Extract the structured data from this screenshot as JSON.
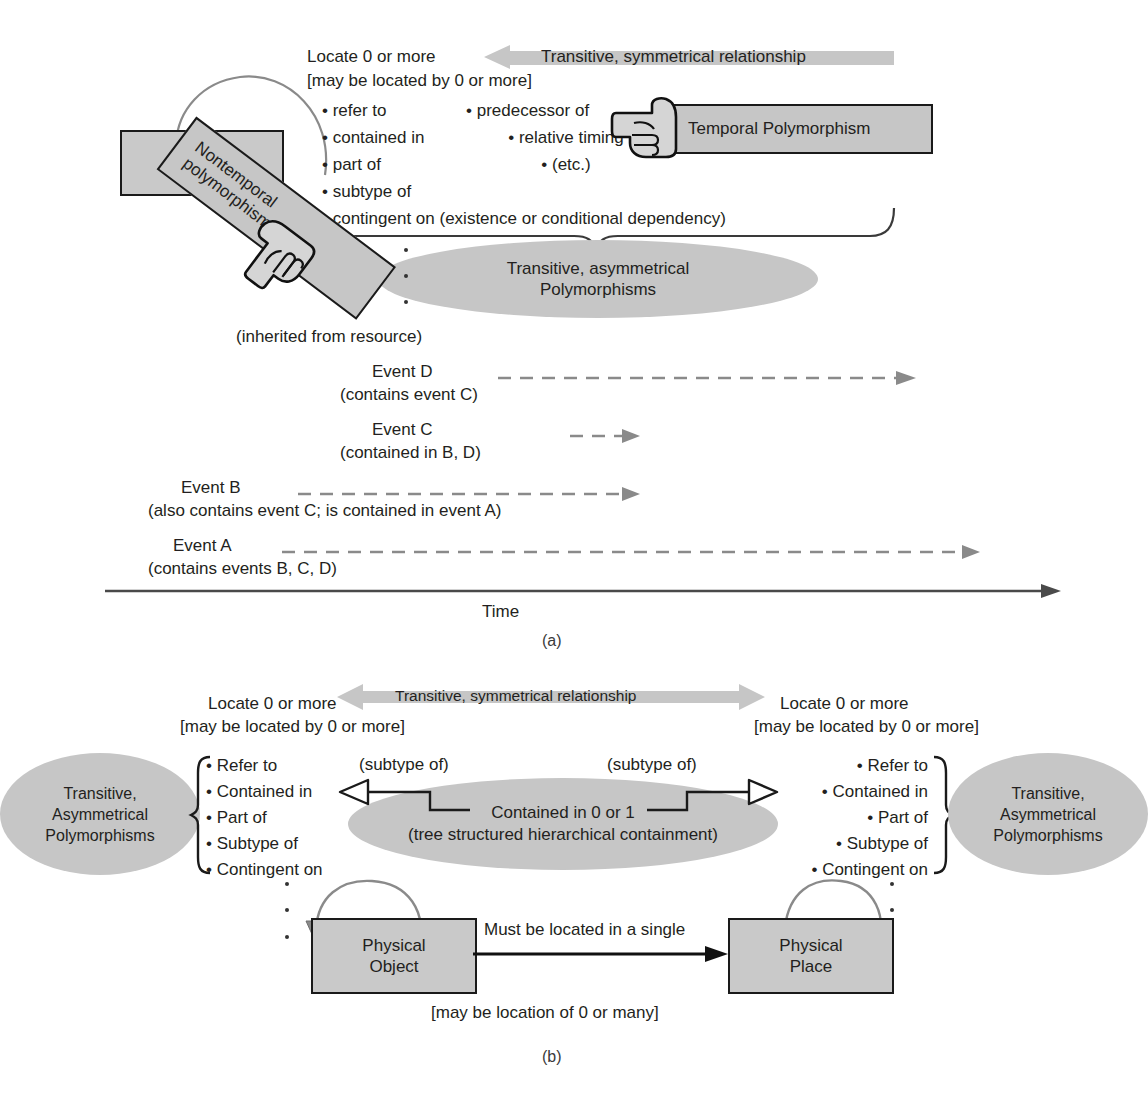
{
  "figure": {
    "panel_a_label": "(a)",
    "panel_b_label": "(b)"
  },
  "panel_a": {
    "event_box": "Event",
    "locate_line1": "Locate 0 or more",
    "locate_line2": "[may be located by 0 or more]",
    "symmetrical_banner": "Transitive, symmetrical relationship",
    "left_list": [
      "refer to",
      "contained in",
      "part of",
      "subtype of",
      "contingent on (existence or conditional dependency)"
    ],
    "temporal_list": [
      "predecessor of",
      "relative timing",
      "(etc.)"
    ],
    "temporal_banner": "Temporal Polymorphism",
    "nontemporal_banner_line1": "Nontemporal",
    "nontemporal_banner_line2": "polymorphism",
    "asym_ellipse_line1": "Transitive, asymmetrical",
    "asym_ellipse_line2": "Polymorphisms",
    "inherited_note": "(inherited from resource)",
    "timeline": {
      "axis_label": "Time",
      "events": [
        {
          "name": "Event D",
          "detail": "(contains event C)"
        },
        {
          "name": "Event C",
          "detail": "(contained in B, D)"
        },
        {
          "name": "Event B",
          "detail": "(also contains event C; is contained in event A)"
        },
        {
          "name": "Event A",
          "detail": "(contains events B, C, D)"
        }
      ]
    }
  },
  "panel_b": {
    "symmetrical_banner": "Transitive, symmetrical relationship",
    "locate_left_line1": "Locate 0 or more",
    "locate_left_line2": "[may be located by 0 or more]",
    "locate_right_line1": "Locate 0 or more",
    "locate_right_line2": "[may be located by 0 or more]",
    "left_ellipse_lines": [
      "Transitive,",
      "Asymmetrical",
      "Polymorphisms"
    ],
    "right_ellipse_lines": [
      "Transitive,",
      "Asymmetrical",
      "Polymorphisms"
    ],
    "left_list": [
      "Refer to",
      "Contained in",
      "Part of",
      "Subtype of",
      "Contingent on"
    ],
    "right_list": [
      "Refer to",
      "Contained in",
      "Part of",
      "Subtype of",
      "Contingent on"
    ],
    "subtype_left": "(subtype of)",
    "subtype_right": "(subtype of)",
    "center_ellipse_line1": "Contained in 0 or 1",
    "center_ellipse_line2": "(tree structured hierarchical containment)",
    "object_box_line1": "Physical",
    "object_box_line2": "Object",
    "place_box_line1": "Physical",
    "place_box_line2": "Place",
    "relation_label": "Must be located in a single",
    "relation_note": "[may be location of  0 or many]"
  },
  "colors": {
    "fill_gray": "#c9c9c9",
    "ellipse_gray": "#c6c6c6",
    "stroke_dark": "#1a1a1a",
    "arrow_gray": "#8a8a8a",
    "text": "#231f20"
  }
}
